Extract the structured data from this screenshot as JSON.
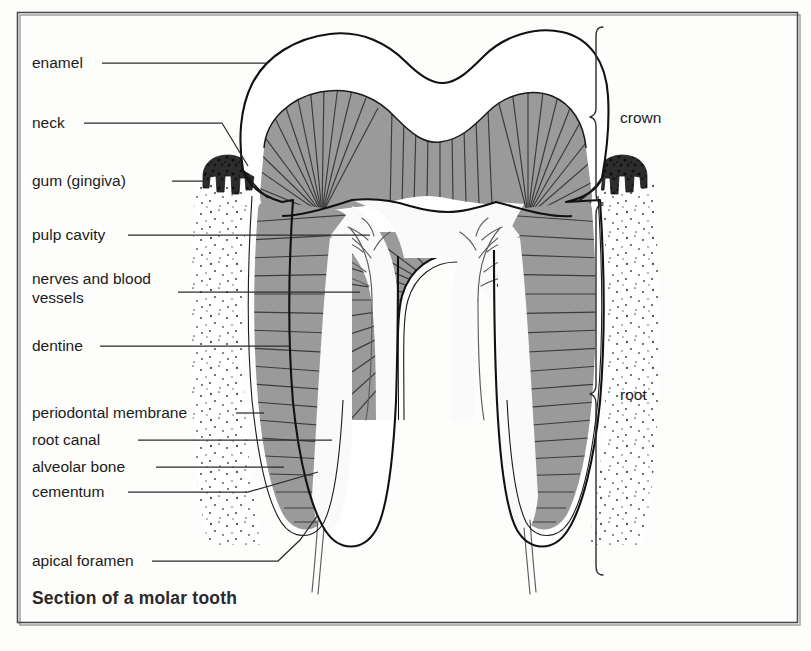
{
  "figure": {
    "caption": "Section of a molar tooth"
  },
  "labels": [
    {
      "id": "enamel",
      "text": "enamel",
      "x": 32,
      "y": 68,
      "lines": 1
    },
    {
      "id": "neck",
      "text": "neck",
      "x": 32,
      "y": 128,
      "lines": 1
    },
    {
      "id": "gum",
      "text": "gum (gingiva)",
      "x": 32,
      "y": 186,
      "lines": 1
    },
    {
      "id": "pulp-cavity",
      "text": "pulp cavity",
      "x": 32,
      "y": 240,
      "lines": 1
    },
    {
      "id": "nerves-vessels-1",
      "text": "nerves and blood",
      "x": 32,
      "y": 284,
      "lines": 2
    },
    {
      "id": "nerves-vessels-2",
      "text": "vessels",
      "x": 32,
      "y": 303,
      "lines": 2
    },
    {
      "id": "dentine",
      "text": "dentine",
      "x": 32,
      "y": 351,
      "lines": 1
    },
    {
      "id": "periodontal-membrane",
      "text": "periodontal membrane",
      "x": 32,
      "y": 418,
      "lines": 1
    },
    {
      "id": "root-canal",
      "text": "root canal",
      "x": 32,
      "y": 445,
      "lines": 1
    },
    {
      "id": "alveolar-bone",
      "text": "alveolar bone",
      "x": 32,
      "y": 472,
      "lines": 1
    },
    {
      "id": "cementum",
      "text": "cementum",
      "x": 32,
      "y": 497,
      "lines": 1
    },
    {
      "id": "apical-foramen",
      "text": "apical foramen",
      "x": 32,
      "y": 566,
      "lines": 1
    }
  ],
  "brackets": [
    {
      "id": "crown",
      "text": "crown",
      "label_x": 620,
      "label_y": 123,
      "top": 27,
      "bottom": 203
    },
    {
      "id": "root",
      "text": "root",
      "label_x": 620,
      "label_y": 400,
      "top": 205,
      "bottom": 575
    }
  ],
  "colors": {
    "page_background": "#fdfdfc",
    "frame_stroke": "#4a4a4a",
    "outline": "#111111",
    "dentine_fill": "#9a9a9a",
    "dentine_hatch": "#3a3a3a",
    "enamel_fill": "#ffffff",
    "pulp_fill": "#fafafa",
    "gum_dark": "#2c2c2c",
    "bone_stipple": "#4d4d4d",
    "cementum_stroke": "#1a1a1a",
    "nerve_stroke": "#5d5d5d",
    "text": "#1b1b1b",
    "caption_text": "#2a2a2a"
  }
}
